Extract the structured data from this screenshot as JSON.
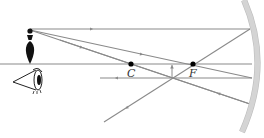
{
  "diagram": {
    "colors": {
      "ray": "#8a8a8a",
      "axis": "#8a8a8a",
      "mirror": "#d4d4d4",
      "mirror_edge": "#bdbdbd",
      "point": "#000000",
      "object": "#111111",
      "label": "#333333"
    },
    "principal_axis": {
      "x1": 0,
      "y1": 64,
      "x2": 252,
      "y2": 64
    },
    "mirror": {
      "top": [
        244,
        0
      ],
      "mid": [
        258,
        64
      ],
      "bottom": [
        242,
        132
      ],
      "width": 5
    },
    "points": [
      {
        "name": "C",
        "label": "C",
        "x": 131,
        "y": 64,
        "label_x": 127,
        "label_y": 68
      },
      {
        "name": "F",
        "label": "F",
        "x": 193,
        "y": 64,
        "label_x": 189,
        "label_y": 68
      }
    ],
    "object": {
      "x": 30,
      "top_y": 30,
      "base_y": 64
    },
    "image_arrow": {
      "x": 172,
      "y1": 65,
      "y2": 77
    },
    "rays": [
      {
        "name": "parallel-ray-incident",
        "points": [
          [
            30,
            29
          ],
          [
            250,
            29
          ]
        ],
        "arrow_at": [
          90,
          29
        ],
        "dir": "right"
      },
      {
        "name": "parallel-ray-reflected",
        "points": [
          [
            250,
            29
          ],
          [
            104,
            122
          ]
        ],
        "arrow_at": [
          128,
          107
        ],
        "dir": "down-left"
      },
      {
        "name": "center-ray-incident",
        "points": [
          [
            30,
            30
          ],
          [
            250,
            104
          ]
        ],
        "arrow_at": [
          80,
          47
        ],
        "dir": "right"
      },
      {
        "name": "focal-ray-incident",
        "points": [
          [
            30,
            30
          ],
          [
            252,
            78
          ]
        ],
        "arrow_at": [
          140,
          54
        ],
        "dir": "right"
      },
      {
        "name": "focal-ray-reflected",
        "points": [
          [
            252,
            78
          ],
          [
            100,
            78
          ]
        ],
        "arrow_at": [
          118,
          78
        ],
        "dir": "left"
      },
      {
        "name": "center-ray-reflected",
        "points": [
          [
            250,
            104
          ],
          [
            60,
            40
          ]
        ],
        "arrow_at": [
          220,
          94
        ],
        "dir": "right"
      }
    ],
    "eye": {
      "apex": [
        13,
        82
      ],
      "x": 38,
      "y": 82
    }
  }
}
